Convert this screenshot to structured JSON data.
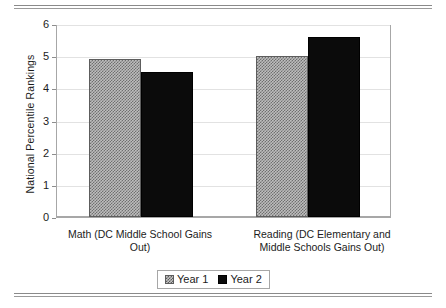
{
  "chart_data": {
    "type": "bar",
    "title": "",
    "xlabel": "",
    "ylabel": "National Percentile Rankings",
    "ylim": [
      0,
      6
    ],
    "yticks": [
      "0",
      "1",
      "2",
      "3",
      "4",
      "5",
      "6"
    ],
    "grid": true,
    "legend_position": "bottom",
    "categories": [
      "Math (DC Middle School Gains Out)",
      "Reading (DC Elementary and Middle Schools Gains Out)"
    ],
    "category_lines": [
      [
        "Math (DC Middle School Gains",
        "Out)"
      ],
      [
        "Reading (DC Elementary and",
        "Middle Schools Gains Out)"
      ]
    ],
    "series": [
      {
        "name": "Year 1",
        "values": [
          4.9,
          5.0
        ],
        "color": "#bdbdbd",
        "pattern": "checker-hatch"
      },
      {
        "name": "Year 2",
        "values": [
          4.5,
          5.6
        ],
        "color": "#0b0b0b",
        "pattern": "solid"
      }
    ]
  },
  "figure": {
    "axis_color": "#a7a7a7",
    "grid_color": "#e2e2e2",
    "rule_color": "#8a8a8a"
  }
}
